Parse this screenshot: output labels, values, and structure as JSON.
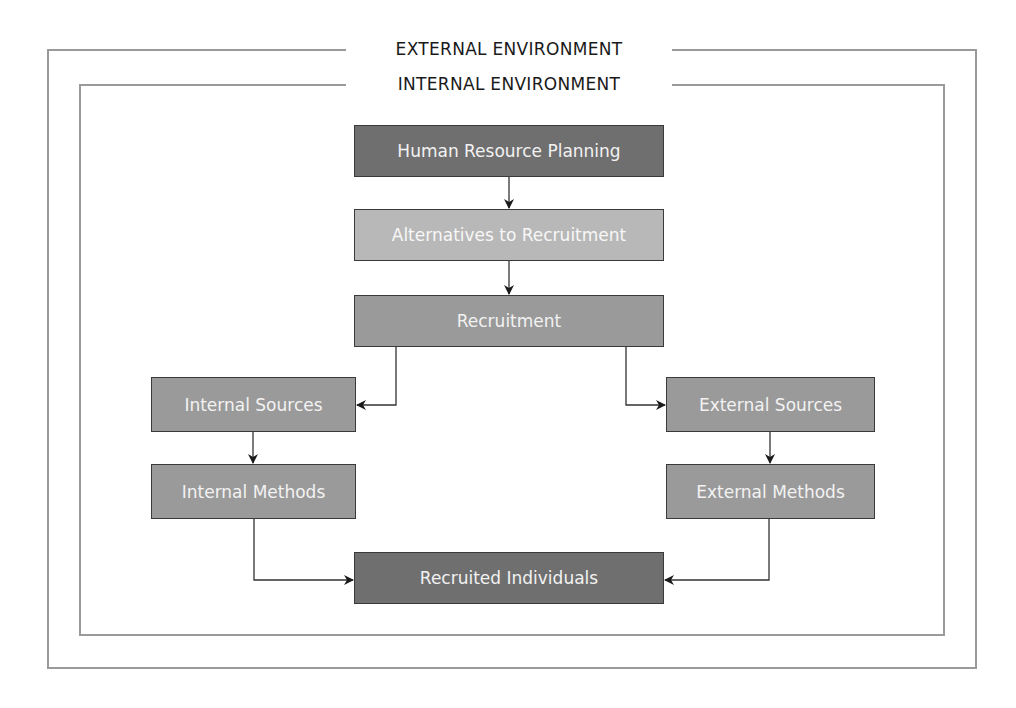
{
  "diagram": {
    "outer_frame": {
      "label": "EXTERNAL ENVIRONMENT"
    },
    "inner_frame": {
      "label": "INTERNAL ENVIRONMENT"
    },
    "nodes": {
      "hrp": {
        "label": "Human Resource Planning",
        "fill": "#6f6f6f"
      },
      "alternatives": {
        "label": "Alternatives to Recruitment",
        "fill": "#b8b8b8"
      },
      "recruitment": {
        "label": "Recruitment",
        "fill": "#9a9a9a"
      },
      "internal_sources": {
        "label": "Internal Sources",
        "fill": "#9a9a9a"
      },
      "external_sources": {
        "label": "External Sources",
        "fill": "#9a9a9a"
      },
      "internal_methods": {
        "label": "Internal Methods",
        "fill": "#9a9a9a"
      },
      "external_methods": {
        "label": "External Methods",
        "fill": "#9a9a9a"
      },
      "recruited_individuals": {
        "label": "Recruited Individuals",
        "fill": "#6f6f6f"
      }
    },
    "edges": [
      {
        "from": "Human Resource Planning",
        "to": "Alternatives to Recruitment"
      },
      {
        "from": "Alternatives to Recruitment",
        "to": "Recruitment"
      },
      {
        "from": "Recruitment",
        "to": "Internal Sources"
      },
      {
        "from": "Recruitment",
        "to": "External Sources"
      },
      {
        "from": "Internal Sources",
        "to": "Internal Methods"
      },
      {
        "from": "External Sources",
        "to": "External Methods"
      },
      {
        "from": "Internal Methods",
        "to": "Recruited Individuals"
      },
      {
        "from": "External Methods",
        "to": "Recruited Individuals"
      }
    ]
  }
}
